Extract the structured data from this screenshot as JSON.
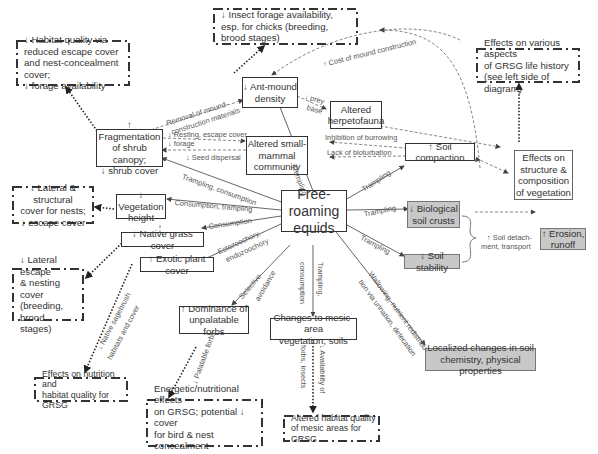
{
  "central": {
    "label": "Free-roaming\nequids"
  },
  "nodes": {
    "habitat_quality": "↓ Habitat quality via\nreduced escape cover\nand nest-concealment cover;\n↓ forage availability",
    "insect_forage": "↓ Insect forage availability,\nesp. for chicks (breeding,\nbrood stages)",
    "effects_life_history": "Effects on various aspects\nof GRSG life history\n(see left side of diagram)",
    "ant_mound": "↓ Ant-mound\ndensity",
    "herpetofauna": "Altered\nherpetofauna",
    "fragmentation": "↑ Fragmentation\nof shrub canopy;\n↓ shrub cover",
    "small_mammal": "Altered small-\nmammal\ncommunity",
    "soil_compaction": "↑ Soil compaction",
    "effects_vegetation": "Effects on\nstructure &\ncomposition\nof vegetation",
    "lateral_structural": "↓ Lateral & structural\ncover for nests;\n↓ escape cover",
    "vegetation_height": "↓ Vegetation\nheight",
    "native_grass": "↓ Native grass cover",
    "exotic_plant": "↑ Exotic plant cover",
    "lateral_escape": "↓ Lateral escape\n& nesting cover\n(breeding, brood\nstages)",
    "biological_crusts": "↓ Biological\nsoil crusts",
    "soil_stability": "↓ Soil stability",
    "erosion": "↑ Erosion,\nrunoff",
    "unpalatable_forbs": "↑ Dominance of\nunpalatable forbs",
    "mesic_changes": "Changes to mesic-area\nvegetation, soils",
    "soil_chemistry": "Localized changes in soil\nchemistry, physical properties",
    "nutrition_habitat": "Effects on nutrition and\nhabitat quality for GRSG",
    "energetic_effects": "Energetic/nutritional effects\non GRSG; potential ↓ cover\nfor bird & nest concealment\n(breeding, brood stages)",
    "mesic_habitat": "Altered habitat quality\nof mesic areas for GRSG"
  },
  "edge_labels": {
    "removal_mound_1": "Removal of mound-",
    "removal_mound_2": "construction materials",
    "cost_mound": "↑ Cost of mound construction",
    "prey": "↓ prey",
    "base": "base",
    "resting": "↓ Resting, escape cover",
    "forage": "↓ forage",
    "seed_dispersal": "↓ Seed dispersal",
    "inhibition_burrowing": "Inhibition of burrowing",
    "lack_bioturbation": "Lack of bioturbation",
    "trampling_consumption": "Trampling, consumption",
    "consumption_trampling": "Consumption, trampling",
    "consumption": "Consumption",
    "ectozoochory": "Ectozoochory,",
    "endozoochory": "endozoochory",
    "selective": "Selective",
    "avoidance": "avoidance",
    "trampling_ant": "Trampling",
    "trampling_compaction": "Trampling",
    "trampling_crusts": "Trampling",
    "trampling_stability": "Trampling",
    "trampling_mesic": "Trampling,",
    "consumption_mesic": "consumption",
    "wallowing_1": "Wallowing, nutrient redistribu-",
    "wallowing_2": "tion via urination, defecation",
    "soil_detach_1": "↑ Soil detach-",
    "soil_detach_2": "ment, transport",
    "native_sagebrush_1": "↓ Native sagebrush",
    "native_sagebrush_2": "habitats and cover",
    "palatable_forbs": "↓ Palatable forbs",
    "availability_1": "↓ Availability of",
    "availability_2": "forbs, insects"
  }
}
